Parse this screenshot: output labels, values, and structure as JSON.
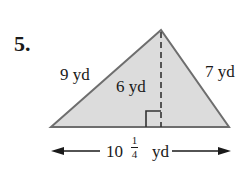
{
  "problem": {
    "number": "5.",
    "figure": "triangle",
    "left_side": "9 yd",
    "right_side": "7 yd",
    "height": "6 yd",
    "base": {
      "whole": "10",
      "numerator": "1",
      "denominator": "4",
      "unit": "yd"
    }
  },
  "colors": {
    "fill": "#dcdcdc",
    "stroke": "#6e6e6e",
    "text": "#1a1a1a"
  }
}
